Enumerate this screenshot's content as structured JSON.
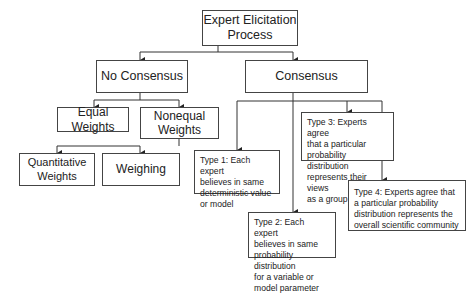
{
  "diagram": {
    "title": "Expert Elicitation Process",
    "root": {
      "label_line1": "Expert Elicitation",
      "label_line2": "Process"
    },
    "no_consensus": {
      "label": "No Consensus",
      "children": {
        "equal": {
          "label": "Equal Weights"
        },
        "nonequal": {
          "label_line1": "Nonequal",
          "label_line2": "Weights",
          "children": {
            "quantitative": {
              "label_line1": "Quantitative",
              "label_line2": "Weights"
            },
            "weighing": {
              "label": "Weighing"
            }
          }
        }
      }
    },
    "consensus": {
      "label": "Consensus",
      "types": [
        {
          "id": "type1",
          "lines": [
            "Type 1: Each expert",
            "believes in same",
            "deterministic value",
            "or model"
          ]
        },
        {
          "id": "type2",
          "lines": [
            "Type 2: Each expert",
            "believes in same",
            "probability distribution",
            "for a variable or",
            "model parameter"
          ]
        },
        {
          "id": "type3",
          "lines": [
            "Type 3: Experts agree",
            "that a particular",
            "probability distribution",
            "represents their views",
            "as a group"
          ]
        },
        {
          "id": "type4",
          "lines": [
            "Type 4: Experts agree that",
            "a particular probability",
            "distribution represents the",
            "overall scientific community"
          ]
        }
      ]
    },
    "edges": [
      [
        "Expert Elicitation Process",
        "No Consensus"
      ],
      [
        "Expert Elicitation Process",
        "Consensus"
      ],
      [
        "No Consensus",
        "Equal Weights"
      ],
      [
        "No Consensus",
        "Nonequal Weights"
      ],
      [
        "Nonequal Weights",
        "Quantitative Weights"
      ],
      [
        "Nonequal Weights",
        "Weighing"
      ],
      [
        "Consensus",
        "Type 1"
      ],
      [
        "Consensus",
        "Type 2"
      ],
      [
        "Consensus",
        "Type 3"
      ],
      [
        "Consensus",
        "Type 4"
      ]
    ],
    "colors": {
      "line": "#333333",
      "border": "#444444",
      "text": "#222222",
      "background": "#ffffff"
    }
  }
}
